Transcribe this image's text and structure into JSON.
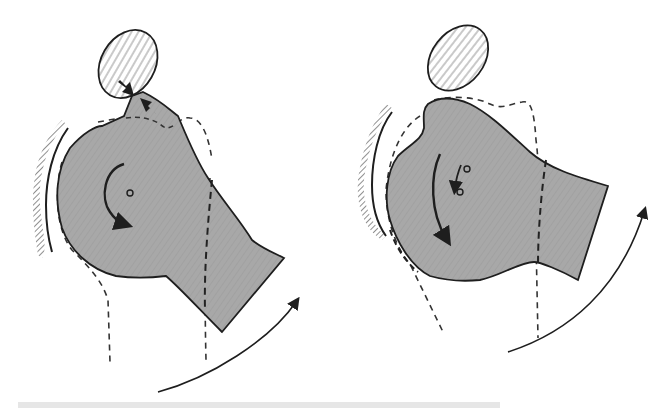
{
  "figure": {
    "colors": {
      "background": "#ffffff",
      "bone_fill": "#a9a9a9",
      "outline": "#1e1e1e",
      "hatch": "#555555",
      "dashed": "#333333",
      "footer_band": "#e6e6e6"
    }
  },
  "panels": [
    {
      "id": "left",
      "label": "impingement",
      "acromion_ellipse": {
        "cx": 128,
        "cy": 64,
        "rx": 28,
        "ry": 38,
        "rotate": 30
      },
      "contact_arrows": 2,
      "rotation_center": {
        "x": 130,
        "y": 193
      },
      "curved_arrow": "counter-clockwise around center",
      "outer_arc_arrow": "sweeping upward at lower right"
    },
    {
      "id": "right",
      "label": "clearance",
      "acromion_ellipse": {
        "cx": 458,
        "cy": 58,
        "rx": 28,
        "ry": 38,
        "rotate": 35
      },
      "contact_arrows": 0,
      "rotation_centers": [
        {
          "x": 467,
          "y": 169
        },
        {
          "x": 460,
          "y": 192
        }
      ],
      "curved_arrow": "downward along left side",
      "outer_arc_arrow": "sweeping upward at lower right"
    }
  ]
}
